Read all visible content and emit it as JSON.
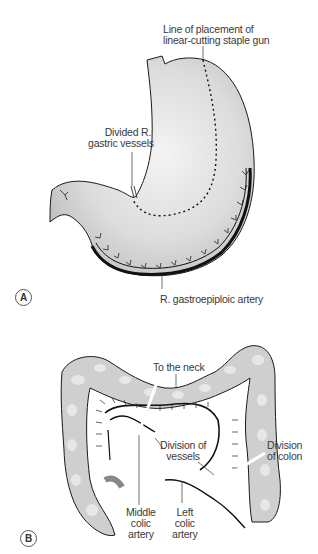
{
  "figure": {
    "panels": [
      {
        "id": "A",
        "subject": "stomach",
        "labels": {
          "staple_line": [
            "Line of placement of",
            "linear-cutting staple gun"
          ],
          "gastric_vessels": [
            "Divided R.",
            "gastric vessels"
          ],
          "gastroepiploic": "R. gastroepiploic artery"
        }
      },
      {
        "id": "B",
        "subject": "colon",
        "labels": {
          "neck": "To the neck",
          "division_vessels": [
            "Division of",
            "vessels"
          ],
          "division_colon": [
            "Division",
            "of colon"
          ],
          "middle_colic": [
            "Middle",
            "colic",
            "artery"
          ],
          "left_colic": [
            "Left",
            "colic",
            "artery"
          ]
        }
      }
    ],
    "colors": {
      "organ_fill": "#d6d6d6",
      "organ_highlight": "#f2f2f2",
      "outline": "#1a1a1a",
      "text": "#3a3a3a"
    }
  }
}
